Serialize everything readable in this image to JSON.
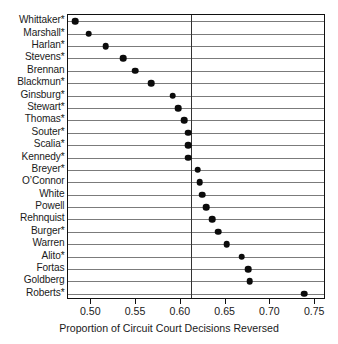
{
  "chart_data": {
    "type": "scatter",
    "subtype": "dot-plot",
    "title": "",
    "xlabel": "Proportion of Circuit Court Decisions Reversed",
    "ylabel": "",
    "xlim": [
      0.4735,
      0.7615
    ],
    "xticks": [
      0.5,
      0.55,
      0.6,
      0.65,
      0.7,
      0.75
    ],
    "xtick_labels": [
      "0.50",
      "0.55",
      "0.60",
      "0.65",
      "0.70",
      "0.75"
    ],
    "grid": "horizontal-rules-per-category",
    "legend": "none",
    "reference_line": 0.611,
    "orientation": "horizontal",
    "marker": "filled-circle",
    "marker_color": "#0b0b0b",
    "categories": [
      "Whittaker*",
      "Marshall*",
      "Harlan*",
      "Stevens*",
      "Brennan",
      "Blackmun*",
      "Ginsburg*",
      "Stewart*",
      "Thomas*",
      "Souter*",
      "Scalia*",
      "Kennedy*",
      "Breyer*",
      "O’Connor",
      "White",
      "Powell",
      "Rehnquist",
      "Burger*",
      "Warren",
      "Alito*",
      "Fortas",
      "Goldberg",
      "Roberts*"
    ],
    "values": [
      0.482,
      0.497,
      0.516,
      0.536,
      0.549,
      0.567,
      0.591,
      0.597,
      0.604,
      0.608,
      0.608,
      0.608,
      0.619,
      0.621,
      0.624,
      0.628,
      0.635,
      0.642,
      0.651,
      0.668,
      0.675,
      0.677,
      0.738
    ]
  },
  "footnote_marker": "*"
}
